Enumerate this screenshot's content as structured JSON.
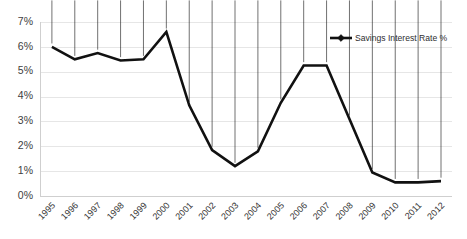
{
  "chart_data": {
    "type": "line",
    "title": "",
    "xlabel": "",
    "ylabel": "",
    "categories": [
      "1995",
      "1996",
      "1997",
      "1998",
      "1999",
      "2000",
      "2001",
      "2002",
      "2003",
      "2004",
      "2005",
      "2006",
      "2007",
      "2008",
      "2009",
      "2010",
      "2011",
      "2012"
    ],
    "values": [
      6.0,
      5.5,
      5.75,
      5.45,
      5.5,
      6.6,
      3.65,
      1.85,
      1.2,
      1.8,
      3.75,
      5.25,
      5.25,
      3.1,
      0.95,
      0.55,
      0.55,
      0.6
    ],
    "series": [
      {
        "name": "Savings Interest Rate %",
        "values": [
          6.0,
          5.5,
          5.75,
          5.45,
          5.5,
          6.6,
          3.65,
          1.85,
          1.2,
          1.8,
          3.75,
          5.25,
          5.25,
          3.1,
          0.95,
          0.55,
          0.55,
          0.6
        ]
      }
    ],
    "ylim": [
      0,
      7
    ],
    "ystep": 1,
    "ytick_labels": [
      "0%",
      "1%",
      "2%",
      "3%",
      "4%",
      "5%",
      "6%",
      "7%"
    ],
    "grid": true,
    "legend_position": "top-right",
    "legend_entries": [
      "Savings Interest Rate %"
    ],
    "marker": "diamond",
    "line_color": "#111111",
    "grid_color": "#e6e6e6",
    "background_color": "#ffffff"
  },
  "legend": {
    "label": "Savings Interest Rate %"
  }
}
